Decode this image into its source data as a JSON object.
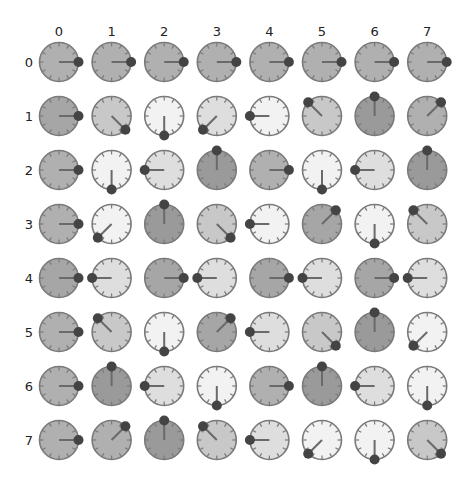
{
  "layout": {
    "col_x0": 59,
    "col_dx": 52.6,
    "row_y0": 62,
    "row_dy": 54,
    "radius": 19.5,
    "col_label_y": 31,
    "row_label_x": 29
  },
  "palette": {
    "dark": "#9a9a9a",
    "med_dark": "#a6a6a6",
    "medium": "#b0b0b0",
    "light_med": "#c8c8c8",
    "light": "#dedede",
    "very_light": "#f2f2f2",
    "border": "#7a7a7a",
    "tick": "#7a7a7a",
    "hand": "#6a6a6a",
    "dot": "#444444"
  },
  "column_labels": [
    "0",
    "1",
    "2",
    "3",
    "4",
    "5",
    "6",
    "7"
  ],
  "row_labels": [
    "0",
    "1",
    "2",
    "3",
    "4",
    "5",
    "6",
    "7"
  ],
  "direction_angles": {
    "N": 0,
    "NE": 45,
    "E": 90,
    "SE": 135,
    "S": 180,
    "SW": 225,
    "W": 270,
    "NW": 315
  },
  "cells": [
    [
      [
        "E",
        "medium"
      ],
      [
        "E",
        "medium"
      ],
      [
        "E",
        "medium"
      ],
      [
        "E",
        "medium"
      ],
      [
        "E",
        "medium"
      ],
      [
        "E",
        "medium"
      ],
      [
        "E",
        "medium"
      ],
      [
        "E",
        "medium"
      ]
    ],
    [
      [
        "E",
        "med_dark"
      ],
      [
        "SE",
        "light_med"
      ],
      [
        "S",
        "very_light"
      ],
      [
        "SW",
        "light"
      ],
      [
        "W",
        "very_light"
      ],
      [
        "NW",
        "light_med"
      ],
      [
        "N",
        "dark"
      ],
      [
        "NE",
        "medium"
      ]
    ],
    [
      [
        "E",
        "medium"
      ],
      [
        "S",
        "very_light"
      ],
      [
        "W",
        "light"
      ],
      [
        "N",
        "dark"
      ],
      [
        "E",
        "medium"
      ],
      [
        "S",
        "very_light"
      ],
      [
        "W",
        "light"
      ],
      [
        "N",
        "dark"
      ]
    ],
    [
      [
        "E",
        "medium"
      ],
      [
        "SW",
        "very_light"
      ],
      [
        "N",
        "dark"
      ],
      [
        "SE",
        "light_med"
      ],
      [
        "W",
        "very_light"
      ],
      [
        "NE",
        "med_dark"
      ],
      [
        "S",
        "very_light"
      ],
      [
        "NW",
        "light_med"
      ]
    ],
    [
      [
        "E",
        "med_dark"
      ],
      [
        "W",
        "light"
      ],
      [
        "E",
        "med_dark"
      ],
      [
        "W",
        "light"
      ],
      [
        "E",
        "med_dark"
      ],
      [
        "W",
        "light"
      ],
      [
        "E",
        "med_dark"
      ],
      [
        "W",
        "light"
      ]
    ],
    [
      [
        "E",
        "medium"
      ],
      [
        "NW",
        "light_med"
      ],
      [
        "S",
        "very_light"
      ],
      [
        "NE",
        "med_dark"
      ],
      [
        "W",
        "light"
      ],
      [
        "SE",
        "light_med"
      ],
      [
        "N",
        "dark"
      ],
      [
        "SW",
        "very_light"
      ]
    ],
    [
      [
        "E",
        "medium"
      ],
      [
        "N",
        "dark"
      ],
      [
        "W",
        "light"
      ],
      [
        "S",
        "very_light"
      ],
      [
        "E",
        "medium"
      ],
      [
        "N",
        "dark"
      ],
      [
        "W",
        "light"
      ],
      [
        "S",
        "very_light"
      ]
    ],
    [
      [
        "E",
        "medium"
      ],
      [
        "NE",
        "medium"
      ],
      [
        "N",
        "dark"
      ],
      [
        "NW",
        "light_med"
      ],
      [
        "W",
        "light"
      ],
      [
        "SW",
        "very_light"
      ],
      [
        "S",
        "very_light"
      ],
      [
        "SE",
        "light_med"
      ]
    ]
  ]
}
